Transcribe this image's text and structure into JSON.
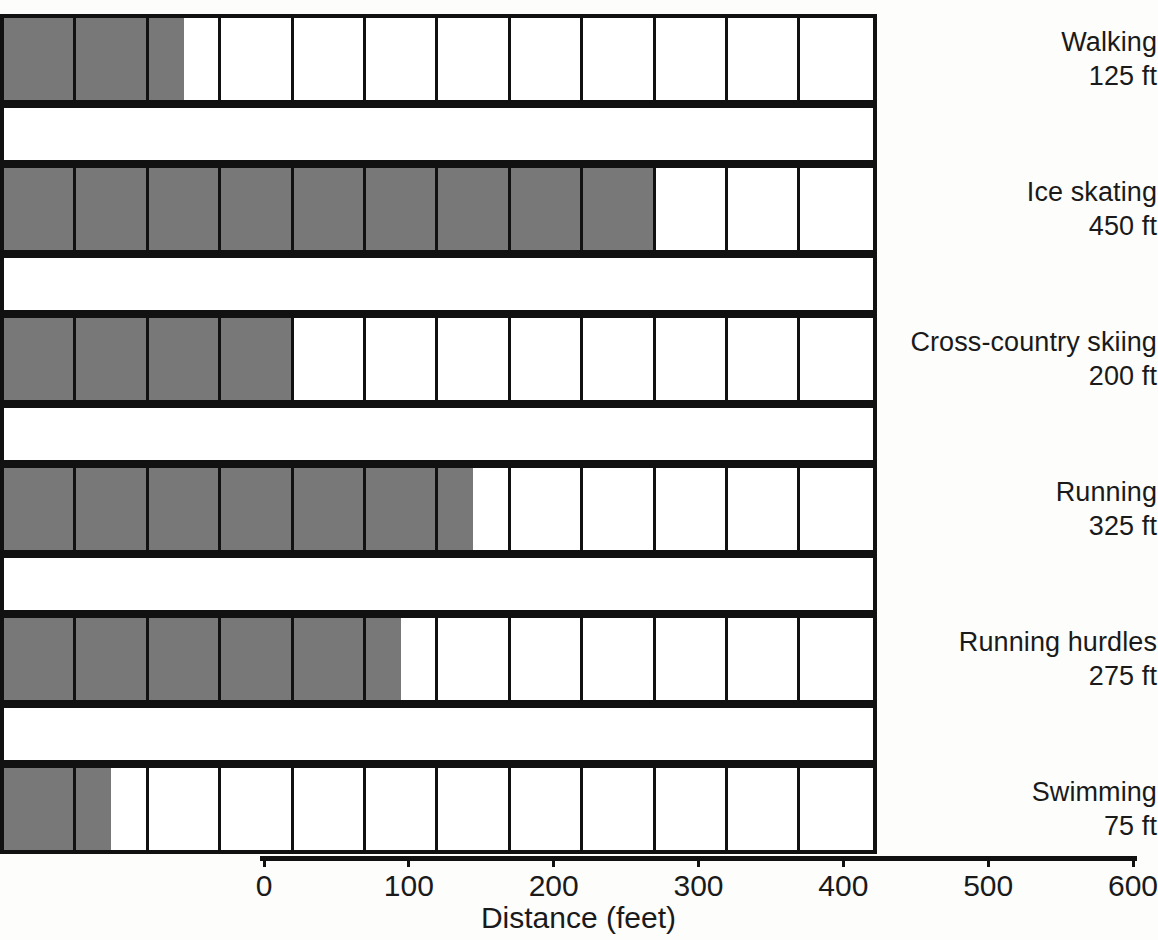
{
  "chart_data": {
    "type": "bar",
    "title": "",
    "subtitle": "",
    "xlabel": "Distance (feet)",
    "ylabel": "",
    "xlim": [
      0,
      600
    ],
    "x_tick_step": 100,
    "x_ticks": [
      0,
      100,
      200,
      300,
      400,
      500,
      600
    ],
    "x_tick_labels": [
      "0",
      "100",
      "200",
      "300",
      "400",
      "500",
      "600"
    ],
    "cell_unit": 50,
    "cells_per_row": 12,
    "grid": false,
    "legend": null,
    "orientation": "horizontal",
    "unit_suffix": "ft",
    "categories": [
      "Walking",
      "Ice skating",
      "Cross-country skiing",
      "Running",
      "Running hurdles",
      "Swimming"
    ],
    "values": [
      125,
      450,
      200,
      325,
      275,
      75
    ],
    "value_labels": [
      "125 ft",
      "450 ft",
      "200 ft",
      "325 ft",
      "275 ft",
      "75 ft"
    ],
    "colors": {
      "fill": "#787878",
      "cell_background": "#ffffff",
      "outline": "#111111",
      "page_background": "#fdfdfb",
      "text": "#1a1a1a"
    }
  },
  "rows": [
    {
      "name": "Walking",
      "value_label": "125 ft",
      "value": 125
    },
    {
      "name": "Ice skating",
      "value_label": "450 ft",
      "value": 450
    },
    {
      "name": "Cross-country skiing",
      "value_label": "200 ft",
      "value": 200
    },
    {
      "name": "Running",
      "value_label": "325 ft",
      "value": 325
    },
    {
      "name": "Running hurdles",
      "value_label": "275 ft",
      "value": 275
    },
    {
      "name": "Swimming",
      "value_label": "75 ft",
      "value": 75
    }
  ],
  "axis": {
    "title": "Distance (feet)",
    "ticks": [
      "0",
      "100",
      "200",
      "300",
      "400",
      "500",
      "600"
    ]
  }
}
